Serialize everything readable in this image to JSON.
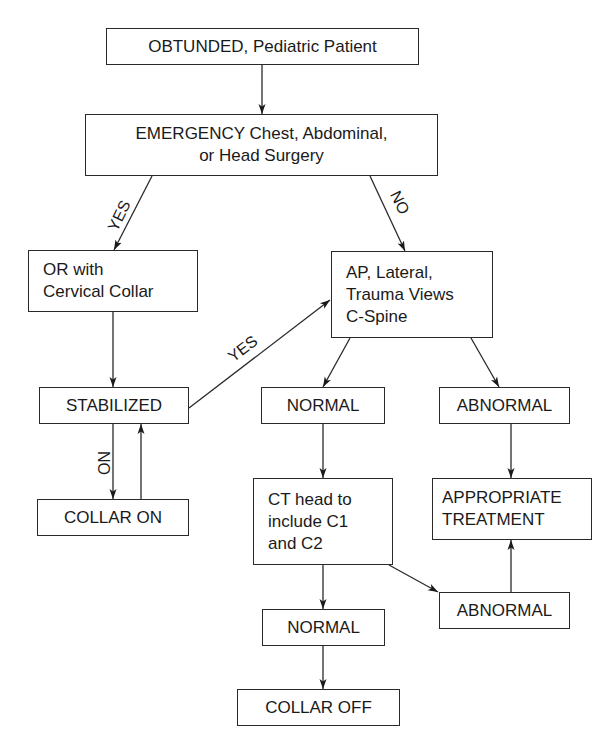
{
  "diagram": {
    "type": "flowchart",
    "colors": {
      "stroke": "#2a2a2a",
      "text": "#1a1a1a",
      "background": "#ffffff"
    },
    "nodes": {
      "start": {
        "lines": [
          "OBTUNDED, Pediatric Patient"
        ]
      },
      "emergency_surgery": {
        "lines": [
          "EMERGENCY Chest, Abdominal,",
          "or Head Surgery"
        ]
      },
      "or_collar": {
        "lines": [
          "OR with",
          "Cervical Collar"
        ]
      },
      "xray_views": {
        "lines": [
          "AP, Lateral,",
          "Trauma Views",
          "C-Spine"
        ]
      },
      "stabilized": {
        "lines": [
          "STABILIZED"
        ]
      },
      "normal_1": {
        "lines": [
          "NORMAL"
        ]
      },
      "abnormal_1": {
        "lines": [
          "ABNORMAL"
        ]
      },
      "collar_on": {
        "lines": [
          "COLLAR ON"
        ]
      },
      "ct_head": {
        "lines": [
          "CT head to",
          "include C1",
          "and C2"
        ]
      },
      "appropriate_treatment": {
        "lines": [
          "APPROPRIATE",
          "TREATMENT"
        ]
      },
      "abnormal_2": {
        "lines": [
          "ABNORMAL"
        ]
      },
      "normal_2": {
        "lines": [
          "NORMAL"
        ]
      },
      "collar_off": {
        "lines": [
          "COLLAR OFF"
        ]
      }
    },
    "edge_labels": {
      "surgery_yes": "YES",
      "surgery_no": "NO",
      "stabilized_yes": "YES",
      "stabilized_no": "NO"
    },
    "edges": [
      {
        "from": "start",
        "to": "emergency_surgery"
      },
      {
        "from": "emergency_surgery",
        "to": "or_collar",
        "label": "YES"
      },
      {
        "from": "emergency_surgery",
        "to": "xray_views",
        "label": "NO"
      },
      {
        "from": "or_collar",
        "to": "stabilized"
      },
      {
        "from": "stabilized",
        "to": "xray_views",
        "label": "YES"
      },
      {
        "from": "stabilized",
        "to": "collar_on",
        "label": "NO"
      },
      {
        "from": "collar_on",
        "to": "stabilized"
      },
      {
        "from": "xray_views",
        "to": "normal_1"
      },
      {
        "from": "xray_views",
        "to": "abnormal_1"
      },
      {
        "from": "normal_1",
        "to": "ct_head"
      },
      {
        "from": "abnormal_1",
        "to": "appropriate_treatment"
      },
      {
        "from": "ct_head",
        "to": "normal_2"
      },
      {
        "from": "ct_head",
        "to": "abnormal_2"
      },
      {
        "from": "abnormal_2",
        "to": "appropriate_treatment"
      },
      {
        "from": "normal_2",
        "to": "collar_off"
      }
    ]
  }
}
